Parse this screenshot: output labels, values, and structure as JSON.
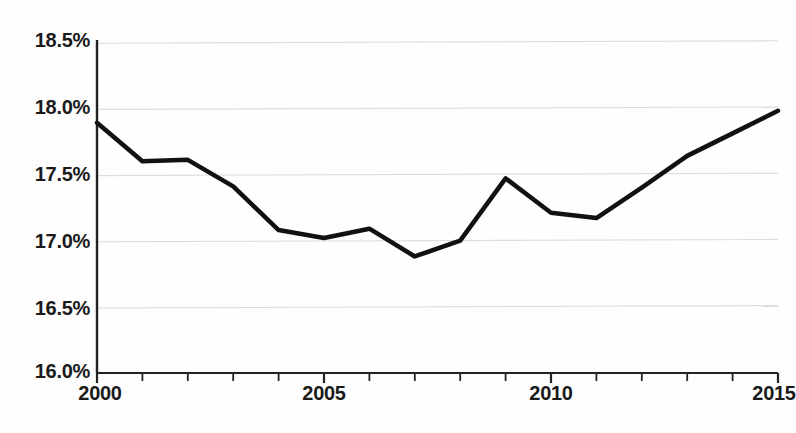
{
  "chart_data": {
    "type": "line",
    "title": "",
    "subtitle": "",
    "xlabel": "",
    "ylabel": "",
    "x": [
      2000,
      2001,
      2002,
      2003,
      2004,
      2005,
      2006,
      2007,
      2008,
      2009,
      2010,
      2011,
      2012,
      2013,
      2014,
      2015
    ],
    "values": [
      17.89,
      17.6,
      17.61,
      17.41,
      17.08,
      17.02,
      17.09,
      16.88,
      17.0,
      17.47,
      17.21,
      17.17,
      17.4,
      17.64,
      17.81,
      17.98
    ],
    "series": [
      {
        "name": "",
        "values": [
          17.89,
          17.6,
          17.61,
          17.41,
          17.08,
          17.02,
          17.09,
          16.88,
          17.0,
          17.47,
          17.21,
          17.17,
          17.4,
          17.64,
          17.81,
          17.98
        ]
      }
    ],
    "xlim": [
      2000,
      2015
    ],
    "ylim": [
      16.0,
      18.5
    ],
    "y_ticks": [
      16.0,
      16.5,
      17.0,
      17.5,
      18.0,
      18.5
    ],
    "y_tick_labels": [
      "16.0%",
      "16.5%",
      "17.0%",
      "17.5%",
      "18.0%",
      "18.5%"
    ],
    "x_ticks": [
      2000,
      2001,
      2002,
      2003,
      2004,
      2005,
      2006,
      2007,
      2008,
      2009,
      2010,
      2011,
      2012,
      2013,
      2014,
      2015
    ],
    "x_tick_labels_shown": [
      "2000",
      "2005",
      "2010",
      "2015"
    ],
    "x_labeled_ticks": [
      2000,
      2005,
      2010,
      2015
    ],
    "grid": true,
    "grid_axis": "y",
    "legend": false,
    "legend_position": "none",
    "markers": false,
    "line_color": "#111111",
    "line_width": 4.5,
    "grid_color": "#dddddd",
    "axis_color": "#222222",
    "background_color": "#fefefe",
    "annotations": []
  },
  "axes": {
    "y_labels": [
      "18.5%",
      "18.0%",
      "17.5%",
      "17.0%",
      "16.5%",
      "16.0%"
    ],
    "x_labels": [
      "2000",
      "2005",
      "2010",
      "2015"
    ]
  }
}
